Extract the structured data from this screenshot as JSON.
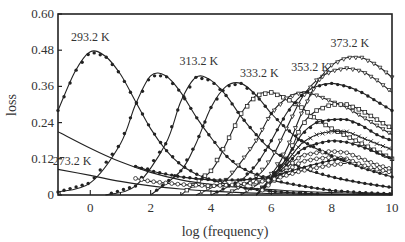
{
  "chart_data": {
    "type": "line",
    "title": "",
    "xlabel": "log (frequency)",
    "ylabel": "loss",
    "xlim": [
      -1.07,
      10
    ],
    "ylim": [
      0,
      0.6
    ],
    "xticks": [
      0,
      2,
      4,
      6,
      8,
      10
    ],
    "xtick_labels": [
      "0",
      "2",
      "4",
      "6",
      "8",
      "10"
    ],
    "yticks": [
      0,
      0.12,
      0.24,
      0.36,
      0.48,
      0.6
    ],
    "ytick_labels": [
      "0",
      "0.12",
      "0.24",
      "0.36",
      "0.48",
      "0.60"
    ],
    "grid": false,
    "legend": "none (inline annotations)",
    "annotations": [
      {
        "text": "293.2 K",
        "x": 0.0,
        "y": 0.51
      },
      {
        "text": "313.2 K",
        "x": 3.6,
        "y": 0.43
      },
      {
        "text": "333.2 K",
        "x": 5.6,
        "y": 0.39
      },
      {
        "text": "353.2 K",
        "x": 7.3,
        "y": 0.41
      },
      {
        "text": "373.2 K",
        "x": 8.6,
        "y": 0.49
      },
      {
        "text": "273.2 K",
        "x": -0.6,
        "y": 0.1
      }
    ],
    "series": [
      {
        "name": "273.2 K (a)",
        "marker": "none",
        "x": [
          -1.07,
          0,
          1,
          2,
          3,
          4,
          5,
          6,
          7,
          8,
          9,
          10
        ],
        "y": [
          0.21,
          0.155,
          0.11,
          0.075,
          0.05,
          0.035,
          0.025,
          0.018,
          0.012,
          0.008,
          0.005,
          0.003
        ]
      },
      {
        "name": "273.2 K (b)",
        "marker": "none",
        "x": [
          -1.07,
          0,
          1,
          2,
          3,
          4,
          5,
          6,
          7,
          8,
          9,
          10
        ],
        "y": [
          0.085,
          0.065,
          0.045,
          0.03,
          0.02,
          0.013,
          0.008,
          0.005,
          0.003,
          0.002,
          0.001,
          0.001
        ]
      },
      {
        "name": "293.2 K",
        "marker": "dot",
        "x": [
          -1.07,
          -0.5,
          0,
          0.5,
          1,
          1.5,
          2,
          2.5,
          3,
          3.5,
          4,
          5,
          6,
          7,
          8,
          9,
          10
        ],
        "y": [
          0.28,
          0.41,
          0.475,
          0.46,
          0.4,
          0.31,
          0.22,
          0.15,
          0.1,
          0.07,
          0.05,
          0.025,
          0.012,
          0.006,
          0.003,
          0.002,
          0.001
        ]
      },
      {
        "name": "303.2 K",
        "marker": "dot",
        "x": [
          -1.07,
          0,
          1,
          1.5,
          2,
          2.5,
          3,
          3.5,
          4,
          4.5,
          5,
          6,
          7,
          8,
          9,
          10
        ],
        "y": [
          0.01,
          0.04,
          0.17,
          0.3,
          0.395,
          0.395,
          0.34,
          0.26,
          0.19,
          0.13,
          0.09,
          0.05,
          0.03,
          0.015,
          0.008,
          0.004
        ]
      },
      {
        "name": "313.2 K",
        "marker": "dot",
        "x": [
          0.5,
          1.5,
          2.5,
          3,
          3.5,
          4,
          4.5,
          5,
          5.5,
          6,
          7,
          8,
          9,
          10
        ],
        "y": [
          0.0,
          0.03,
          0.17,
          0.31,
          0.39,
          0.38,
          0.33,
          0.26,
          0.2,
          0.15,
          0.09,
          0.06,
          0.04,
          0.025
        ]
      },
      {
        "name": "323.2 K",
        "marker": "dot",
        "x": [
          2.0,
          3,
          3.5,
          4,
          4.5,
          5,
          5.5,
          6,
          6.5,
          7,
          8,
          9,
          10
        ],
        "y": [
          0.0,
          0.08,
          0.17,
          0.29,
          0.36,
          0.37,
          0.33,
          0.27,
          0.22,
          0.18,
          0.13,
          0.09,
          0.06
        ]
      },
      {
        "name": "333.2 K",
        "marker": "open-square",
        "x": [
          3.0,
          4,
          4.5,
          5,
          5.5,
          6,
          6.5,
          7,
          7.5,
          8,
          9,
          10
        ],
        "y": [
          0.0,
          0.08,
          0.17,
          0.27,
          0.33,
          0.34,
          0.32,
          0.29,
          0.25,
          0.22,
          0.17,
          0.12
        ]
      },
      {
        "name": "343.2 K",
        "marker": "triangle",
        "x": [
          3.5,
          4.5,
          5,
          5.5,
          6,
          6.5,
          7,
          7.5,
          8,
          8.5,
          9,
          10
        ],
        "y": [
          0.0,
          0.05,
          0.11,
          0.18,
          0.27,
          0.32,
          0.34,
          0.33,
          0.31,
          0.29,
          0.26,
          0.2
        ]
      },
      {
        "name": "353.2 K",
        "marker": "dot",
        "x": [
          4.0,
          5,
          5.5,
          6,
          6.5,
          7,
          7.5,
          8,
          8.5,
          9,
          9.5,
          10
        ],
        "y": [
          0.0,
          0.05,
          0.1,
          0.18,
          0.27,
          0.33,
          0.36,
          0.37,
          0.36,
          0.34,
          0.31,
          0.28
        ]
      },
      {
        "name": "363.2 K",
        "marker": "triangle",
        "x": [
          4.5,
          5.5,
          6,
          6.5,
          7,
          7.5,
          8,
          8.5,
          9,
          9.5,
          10
        ],
        "y": [
          0.0,
          0.06,
          0.12,
          0.22,
          0.32,
          0.38,
          0.41,
          0.42,
          0.41,
          0.38,
          0.34
        ]
      },
      {
        "name": "373.2 K",
        "marker": "triangle",
        "x": [
          5.0,
          6,
          6.5,
          7,
          7.5,
          8,
          8.5,
          9,
          9.5,
          10
        ],
        "y": [
          0.0,
          0.07,
          0.15,
          0.27,
          0.37,
          0.43,
          0.455,
          0.455,
          0.43,
          0.39
        ]
      },
      {
        "name": "high-f 1",
        "marker": "open-square",
        "x": [
          5.5,
          6.5,
          7,
          7.5,
          8,
          8.5,
          9,
          9.5,
          10
        ],
        "y": [
          0.0,
          0.12,
          0.23,
          0.28,
          0.3,
          0.3,
          0.28,
          0.25,
          0.22
        ]
      },
      {
        "name": "high-f 2",
        "marker": "dot",
        "x": [
          5.5,
          6.5,
          7,
          7.5,
          8,
          8.5,
          9,
          9.5,
          10
        ],
        "y": [
          0.0,
          0.12,
          0.2,
          0.24,
          0.25,
          0.25,
          0.23,
          0.2,
          0.18
        ]
      },
      {
        "name": "high-f 3",
        "marker": "cross",
        "x": [
          5.5,
          6.5,
          7,
          7.5,
          8,
          8.5,
          9,
          9.5,
          10
        ],
        "y": [
          0.0,
          0.11,
          0.17,
          0.2,
          0.21,
          0.21,
          0.19,
          0.17,
          0.15
        ]
      },
      {
        "name": "high-f 4",
        "marker": "dot",
        "x": [
          5.5,
          6.5,
          7,
          7.5,
          8,
          8.5,
          9,
          9.5,
          10
        ],
        "y": [
          0.0,
          0.1,
          0.15,
          0.17,
          0.18,
          0.175,
          0.16,
          0.14,
          0.12
        ]
      },
      {
        "name": "high-f 5",
        "marker": "open-circle",
        "x": [
          5.5,
          6.5,
          7,
          7.5,
          8,
          8.5,
          9,
          9.5,
          10
        ],
        "y": [
          0.0,
          0.09,
          0.13,
          0.14,
          0.145,
          0.14,
          0.12,
          0.1,
          0.085
        ]
      },
      {
        "name": "high-f 6",
        "marker": "open-circle",
        "x": [
          5.5,
          6.5,
          7,
          7.5,
          8,
          8.5,
          9,
          9.5,
          10
        ],
        "y": [
          0.0,
          0.08,
          0.11,
          0.12,
          0.125,
          0.12,
          0.1,
          0.085,
          0.075
        ]
      },
      {
        "name": "low-f dots",
        "marker": "dot",
        "x": [
          1.5,
          2,
          3,
          4,
          5,
          6,
          7,
          8,
          8.5
        ],
        "y": [
          0.095,
          0.08,
          0.06,
          0.05,
          0.05,
          0.06,
          0.09,
          0.115,
          0.12
        ]
      },
      {
        "name": "low-f circles",
        "marker": "open-circle",
        "x": [
          1.5,
          2,
          3,
          4,
          5,
          6,
          7,
          8,
          8.5
        ],
        "y": [
          0.055,
          0.045,
          0.035,
          0.03,
          0.035,
          0.05,
          0.08,
          0.1,
          0.105
        ]
      }
    ]
  }
}
